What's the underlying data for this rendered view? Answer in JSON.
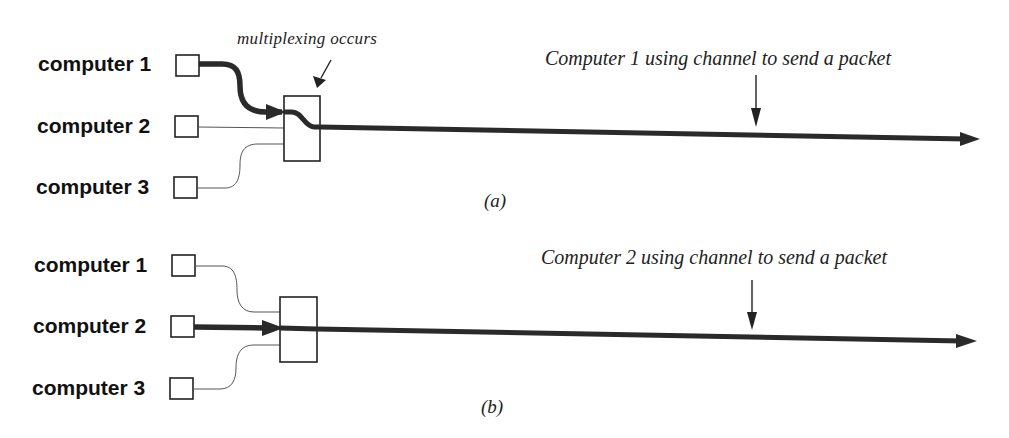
{
  "figure": {
    "panels": [
      {
        "id": "a",
        "sublabel": "(a)",
        "computers": [
          {
            "label": "computer 1",
            "active": true
          },
          {
            "label": "computer 2",
            "active": false
          },
          {
            "label": "computer 3",
            "active": false
          }
        ],
        "mux_annotation": "multiplexing occurs",
        "channel_annotation": "Computer 1 using channel to send a packet"
      },
      {
        "id": "b",
        "sublabel": "(b)",
        "computers": [
          {
            "label": "computer 1",
            "active": false
          },
          {
            "label": "computer 2",
            "active": true
          },
          {
            "label": "computer 3",
            "active": false
          }
        ],
        "channel_annotation": "Computer 2 using channel to send a packet"
      }
    ],
    "colors": {
      "line": "#2a2a2a",
      "thin_line": "#555555",
      "background": "#ffffff"
    }
  }
}
